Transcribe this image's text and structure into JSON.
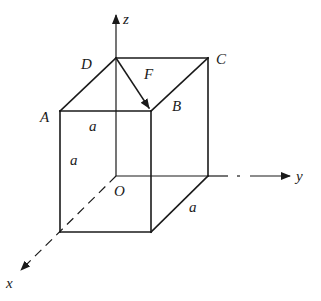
{
  "diagram": {
    "axes": {
      "x": "x",
      "y": "y",
      "z": "z",
      "origin": "O"
    },
    "vertices": {
      "A": "A",
      "B": "B",
      "C": "C",
      "D": "D"
    },
    "force": "F",
    "dimensions": {
      "top_edge": "a",
      "vertical_edge": "a",
      "depth_edge": "a"
    },
    "colors": {
      "stroke": "#1a1a1a",
      "background": "#ffffff"
    }
  }
}
